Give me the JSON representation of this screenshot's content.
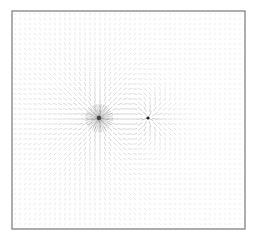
{
  "chart_data": {
    "type": "quiver",
    "title": "",
    "xlabel": "",
    "ylabel": "",
    "axes_visible": false,
    "grid": false,
    "legend": null,
    "frame": {
      "x": 12,
      "y": 11,
      "width": 233,
      "height": 218,
      "color": "#777777"
    },
    "grid_spacing_px": 5,
    "arrow_color": "#8a8a8a",
    "charges": [
      {
        "name": "source",
        "x": 99,
        "y": 118,
        "q": 1.0,
        "marker_color": "#444444",
        "marker_radius": 2.2
      },
      {
        "name": "sink",
        "x": 148,
        "y": 118,
        "q": -0.35,
        "marker_color": "#222222",
        "marker_radius": 1.6
      }
    ],
    "field": "electric field of two point charges, normalized arrow direction, length scaled by log magnitude"
  }
}
